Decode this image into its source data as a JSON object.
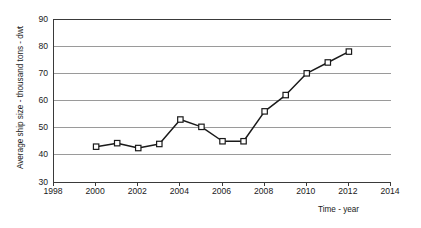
{
  "chart_data": {
    "type": "line",
    "title": "",
    "subtitle": "",
    "xlabel": "Time - year",
    "ylabel": "Average ship size - thousand tons - dwt",
    "xlim": [
      1998,
      2014
    ],
    "ylim": [
      30,
      90
    ],
    "xticks": [
      1998,
      2000,
      2002,
      2004,
      2006,
      2008,
      2010,
      2012,
      2014
    ],
    "yticks": [
      30,
      40,
      50,
      60,
      70,
      80,
      90
    ],
    "xtick_labels": [
      "1998",
      "2000",
      "2002",
      "2004",
      "2006",
      "2008",
      "2010",
      "2012",
      "2014"
    ],
    "ytick_labels": [
      "30",
      "40",
      "50",
      "60",
      "70",
      "80",
      "90"
    ],
    "grid": "horizontal",
    "legend": "none",
    "marker": "open-square",
    "line_color": "#1a1a1a",
    "marker_fill": "#ffffff",
    "marker_edge": "#1a1a1a",
    "grid_color": "#9a9a9a",
    "axis_color": "#3a3a3a",
    "background": "#ffffff",
    "x": [
      2000,
      2001,
      2002,
      2003,
      2004,
      2005,
      2006,
      2007,
      2008,
      2009,
      2010,
      2011,
      2012
    ],
    "values": [
      43.0,
      44.3,
      42.5,
      44.0,
      53.0,
      50.3,
      45.0,
      45.0,
      56.0,
      62.0,
      70.0,
      74.0,
      78.0
    ],
    "series": [
      {
        "name": "Average ship size",
        "values": [
          43.0,
          44.3,
          42.5,
          44.0,
          53.0,
          50.3,
          45.0,
          45.0,
          56.0,
          62.0,
          70.0,
          74.0,
          78.0
        ]
      }
    ]
  },
  "axis_titles": {
    "y": "Average ship size - thousand tons - dwt",
    "x": "Time - year"
  }
}
